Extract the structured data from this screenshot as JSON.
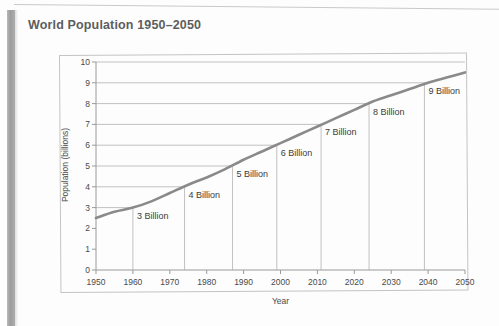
{
  "document": {
    "title": "World Population 1950–2050"
  },
  "chart_data": {
    "type": "line",
    "title": "World Population 1950–2050",
    "xlabel": "Year",
    "ylabel": "Population (billions)",
    "xlim": [
      1950,
      2050
    ],
    "ylim": [
      0,
      10
    ],
    "grid": "horizontal-partial",
    "legend": "none",
    "x_ticks": [
      "1950",
      "1960",
      "1970",
      "1980",
      "1990",
      "2000",
      "2010",
      "2020",
      "2030",
      "2040",
      "2050"
    ],
    "y_ticks": [
      "0",
      "1",
      "2",
      "3",
      "4",
      "5",
      "6",
      "7",
      "8",
      "9",
      "10"
    ],
    "series": [
      {
        "name": "World population",
        "x": [
          1950,
          1955,
          1960,
          1965,
          1970,
          1975,
          1980,
          1985,
          1990,
          1995,
          2000,
          2005,
          2010,
          2015,
          2020,
          2025,
          2030,
          2035,
          2040,
          2045,
          2050
        ],
        "values": [
          2.5,
          2.8,
          3.0,
          3.3,
          3.7,
          4.1,
          4.45,
          4.85,
          5.3,
          5.7,
          6.1,
          6.5,
          6.9,
          7.3,
          7.7,
          8.1,
          8.4,
          8.7,
          9.0,
          9.25,
          9.5
        ]
      }
    ],
    "annotations": [
      {
        "label": "3 Billion",
        "year": 1960,
        "value": 3
      },
      {
        "label": "4 Billion",
        "year": 1974,
        "value": 4
      },
      {
        "label": "5 Billion",
        "year": 1987,
        "value": 5
      },
      {
        "label": "6 Billion",
        "year": 1999,
        "value": 6
      },
      {
        "label": "7 Billion",
        "year": 2011,
        "value": 7
      },
      {
        "label": "8 Billion",
        "year": 2024,
        "value": 8
      },
      {
        "label": "9 Billion",
        "year": 2039,
        "value": 9
      }
    ],
    "style": {
      "line_color": "#8a8a8a",
      "grid_color": "#a8a8a8",
      "axis_color": "#9a9a9a",
      "text_color": "#4a4a4a"
    }
  }
}
